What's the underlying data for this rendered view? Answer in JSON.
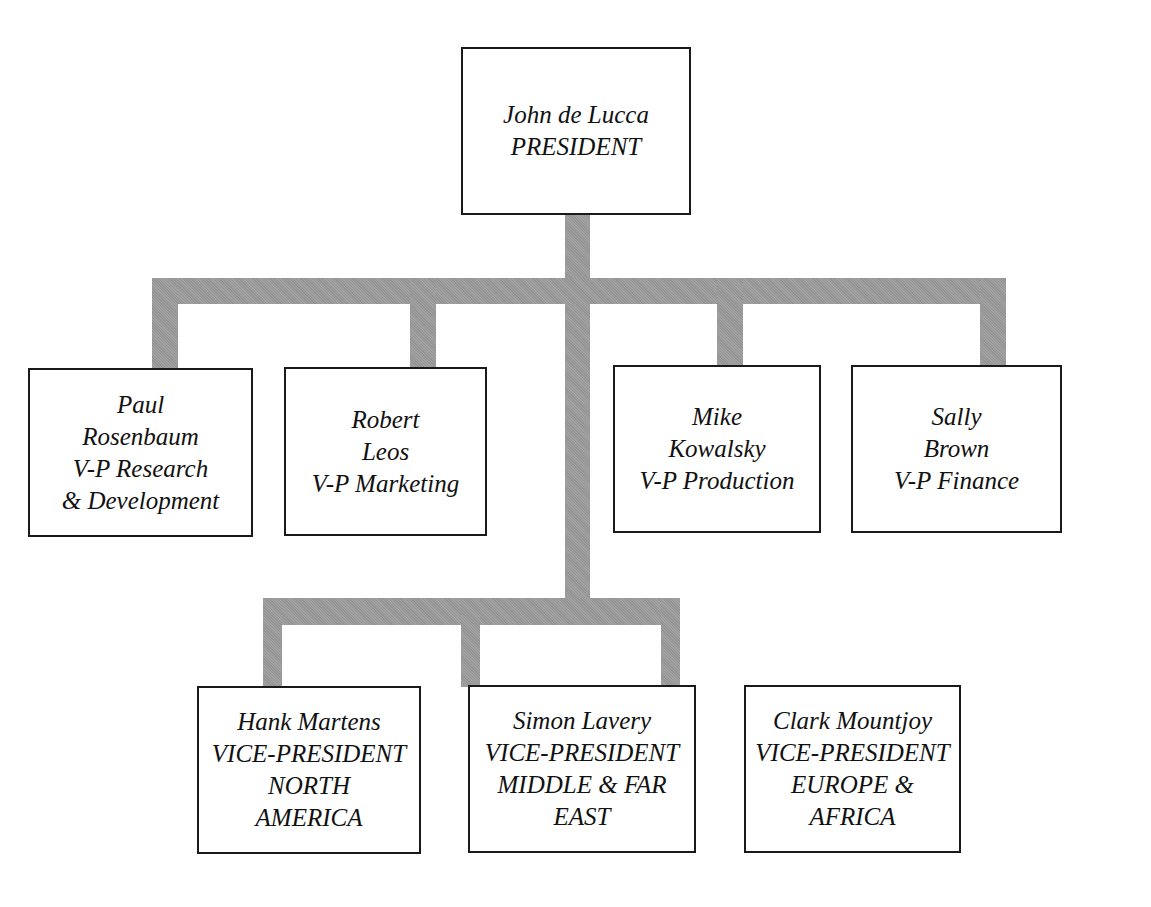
{
  "title": {
    "text": "",
    "note_visible": "clipped heading at top edge"
  },
  "president": {
    "lines": [
      "John de Lucca",
      "PRESIDENT"
    ]
  },
  "vice_presidents": [
    {
      "lines": [
        "Paul",
        "Rosenbaum",
        "V-P Research",
        "& Development"
      ]
    },
    {
      "lines": [
        "Robert",
        "Leos",
        "V-P Marketing"
      ]
    },
    {
      "lines": [
        "Mike",
        "Kowalsky",
        "V-P Production"
      ]
    },
    {
      "lines": [
        "Sally",
        "Brown",
        "V-P Finance"
      ]
    }
  ],
  "regional_vps": [
    {
      "lines": [
        "Hank Martens",
        "VICE-PRESIDENT",
        "NORTH",
        "AMERICA"
      ]
    },
    {
      "lines": [
        "Simon Lavery",
        "VICE-PRESIDENT",
        "MIDDLE & FAR",
        "EAST"
      ]
    },
    {
      "lines": [
        "Clark Mountjoy",
        "VICE-PRESIDENT",
        "EUROPE &",
        "AFRICA"
      ]
    }
  ],
  "colors": {
    "connector": "#9c9c9c",
    "box_border": "#1a1a1a",
    "text": "#111111",
    "background": "#ffffff"
  }
}
